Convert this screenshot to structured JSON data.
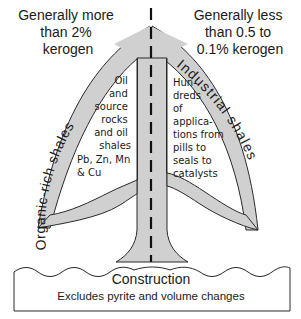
{
  "colors": {
    "arrow_fill": "#d0d0d0",
    "outline": "#2a2a2a",
    "text": "#1a1a1a",
    "background": "#ffffff"
  },
  "top_left": {
    "lines": [
      "Generally more",
      "than 2%",
      "kerogen"
    ]
  },
  "top_right": {
    "lines": [
      "Generally less",
      "than 0.5 to",
      "0.1% kerogen"
    ]
  },
  "left_arc_label": "Organic-rich shales",
  "right_arc_label": "Industrial shales",
  "left_inner": {
    "lines": [
      "Oil",
      "and",
      "source",
      "rocks",
      "and oil",
      "shales"
    ],
    "metals": [
      "Pb, Zn, Mn",
      "& Cu"
    ]
  },
  "right_inner": {
    "lines": [
      "Hun-",
      "dreds",
      "of",
      "applica-",
      "tions from",
      "pills to",
      "seals to",
      "catalysts"
    ]
  },
  "base": {
    "title": "Construction",
    "subtitle": "Excludes pyrite and volume changes"
  }
}
